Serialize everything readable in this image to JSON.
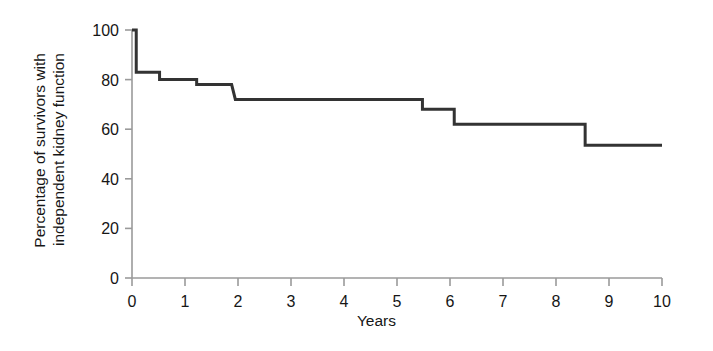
{
  "chart_data": {
    "type": "line",
    "subtype": "kaplan-meier-step",
    "title": "",
    "xlabel": "Years",
    "ylabel": "Percentage of survivors with independent kidney function",
    "ylabel_lines": [
      "Percentage of survivors with",
      "independent kidney function"
    ],
    "xlim": [
      0,
      10
    ],
    "ylim": [
      0,
      100
    ],
    "xticks": [
      0,
      1,
      2,
      3,
      4,
      5,
      6,
      7,
      8,
      9,
      10
    ],
    "xticklabels": [
      "0",
      "1",
      "2",
      "3",
      "4",
      "5",
      "6",
      "7",
      "8",
      "9",
      "10"
    ],
    "yticks": [
      0,
      20,
      40,
      60,
      80,
      100
    ],
    "yticklabels": [
      "0",
      "20",
      "40",
      "60",
      "80",
      "100"
    ],
    "grid": false,
    "legend": null,
    "series": [
      {
        "name": "Independent kidney function",
        "step": "post",
        "color": "#333333",
        "linewidth": 3,
        "x": [
          0.0,
          0.08,
          0.08,
          0.52,
          0.52,
          1.22,
          1.22,
          1.88,
          1.95,
          1.95,
          5.48,
          5.48,
          6.08,
          6.08,
          8.55,
          8.55,
          10.0
        ],
        "y": [
          100,
          100,
          83,
          83,
          80,
          80,
          78,
          78,
          72,
          72,
          72,
          68,
          68,
          62,
          62,
          53.5,
          53.5
        ],
        "drop_points": [
          {
            "x": 0.08,
            "from": 100,
            "to": 83
          },
          {
            "x": 0.52,
            "from": 83,
            "to": 80
          },
          {
            "x": 1.22,
            "from": 80,
            "to": 78
          },
          {
            "x": 1.92,
            "from": 78,
            "to": 72
          },
          {
            "x": 5.48,
            "from": 72,
            "to": 68
          },
          {
            "x": 6.08,
            "from": 68,
            "to": 62
          },
          {
            "x": 8.55,
            "from": 62,
            "to": 53.5
          }
        ]
      }
    ],
    "axis_color": "#9a9a9a",
    "curve_color": "#333333"
  }
}
